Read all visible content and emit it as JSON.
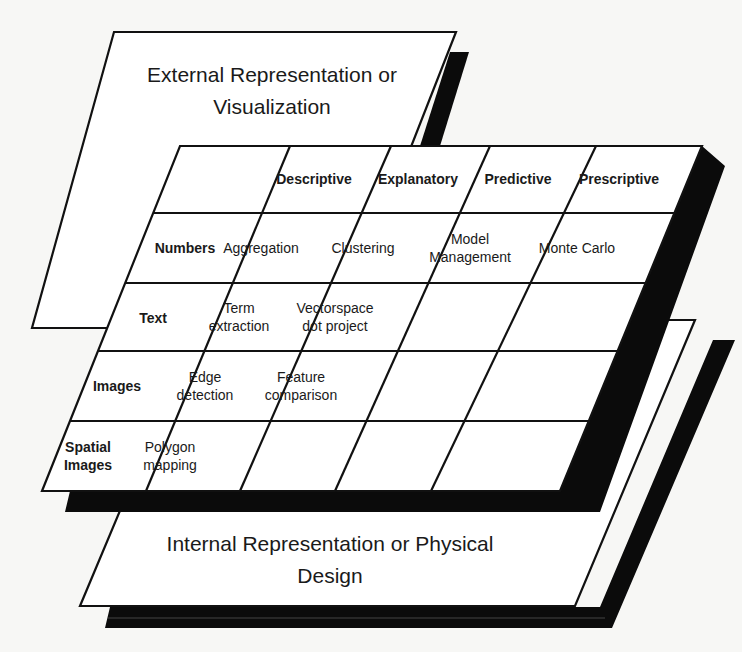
{
  "diagram": {
    "top_layer": {
      "title_line1": "External Representation or",
      "title_line2": "Visualization"
    },
    "bottom_layer": {
      "title_line1": "Internal Representation or Physical",
      "title_line2": "Design"
    },
    "grid": {
      "columns": [
        "Descriptive",
        "Explanatory",
        "Predictive",
        "Prescriptive"
      ],
      "rows": [
        {
          "label_line1": "Numbers",
          "label_line2": "",
          "cells": [
            {
              "l1": "Aggregation",
              "l2": ""
            },
            {
              "l1": "Clustering",
              "l2": ""
            },
            {
              "l1": "Model",
              "l2": "Management"
            },
            {
              "l1": "Monte Carlo",
              "l2": ""
            }
          ]
        },
        {
          "label_line1": "Text",
          "label_line2": "",
          "cells": [
            {
              "l1": "Term",
              "l2": "extraction"
            },
            {
              "l1": "Vectorspace",
              "l2": "dot project"
            },
            {
              "l1": "",
              "l2": ""
            },
            {
              "l1": "",
              "l2": ""
            }
          ]
        },
        {
          "label_line1": "Images",
          "label_line2": "",
          "cells": [
            {
              "l1": "Edge",
              "l2": "detection"
            },
            {
              "l1": "Feature",
              "l2": "comparison"
            },
            {
              "l1": "",
              "l2": ""
            },
            {
              "l1": "",
              "l2": ""
            }
          ]
        },
        {
          "label_line1": "Spatial",
          "label_line2": "Images",
          "cells": [
            {
              "l1": "Polygon",
              "l2": "mapping"
            },
            {
              "l1": "",
              "l2": ""
            },
            {
              "l1": "",
              "l2": ""
            },
            {
              "l1": "",
              "l2": ""
            }
          ]
        }
      ]
    },
    "colors": {
      "plane_fill": "#ffffff",
      "line": "#111111",
      "shadow": "#0b0b0b",
      "background": "#f7f7f5"
    }
  }
}
